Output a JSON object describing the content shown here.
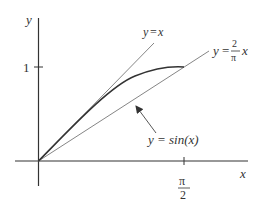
{
  "figure": {
    "axes": {
      "x_label": "x",
      "y_label": "y",
      "y_tick_label": "1",
      "x_tick_numerator": "π",
      "x_tick_denominator": "2"
    },
    "curves": {
      "line_identity": {
        "label_y": "y",
        "label_eq": "=",
        "label_x": "x"
      },
      "line_chord": {
        "label_y": "y",
        "label_eq": "=",
        "coef_num": "2",
        "coef_den": "π",
        "label_x": "x"
      },
      "sine": {
        "label": "y = sin(x)"
      }
    },
    "colors": {
      "axis": "#333333",
      "thin_line": "#666666",
      "curve": "#333333"
    }
  }
}
